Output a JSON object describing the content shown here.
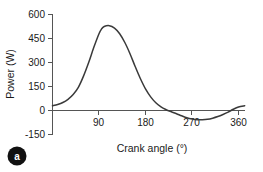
{
  "chart_data": {
    "type": "line",
    "title": "",
    "panel_letter": "a",
    "xlabel": "Crank angle (°)",
    "ylabel": "Power (W)",
    "xlim": [
      0,
      375
    ],
    "ylim": [
      -150,
      600
    ],
    "xticks": [
      90,
      180,
      270,
      360
    ],
    "xtick_labels": [
      "90",
      "180",
      "270",
      "360"
    ],
    "yticks": [
      -150,
      0,
      150,
      300,
      450,
      600
    ],
    "ytick_labels": [
      "-150",
      "0",
      "150",
      "300",
      "450",
      "600"
    ],
    "grid": false,
    "legend": false,
    "series": [
      {
        "name": "Power",
        "x": [
          0,
          10,
          20,
          30,
          40,
          50,
          60,
          70,
          80,
          90,
          95,
          100,
          110,
          120,
          130,
          140,
          150,
          160,
          170,
          180,
          190,
          200,
          210,
          220,
          230,
          240,
          250,
          260,
          270,
          280,
          290,
          300,
          310,
          320,
          330,
          340,
          350,
          360,
          372
        ],
        "y": [
          30,
          38,
          50,
          70,
          100,
          145,
          215,
          300,
          395,
          480,
          510,
          525,
          530,
          515,
          480,
          425,
          355,
          275,
          200,
          135,
          85,
          48,
          22,
          5,
          -8,
          -20,
          -33,
          -45,
          -53,
          -58,
          -58,
          -55,
          -48,
          -38,
          -25,
          -10,
          8,
          22,
          30
        ]
      }
    ],
    "ytick_label_values": {
      "600": "600",
      "450": "450",
      "300": "300",
      "150": "150",
      "0": "0",
      "-150": "-150"
    }
  }
}
